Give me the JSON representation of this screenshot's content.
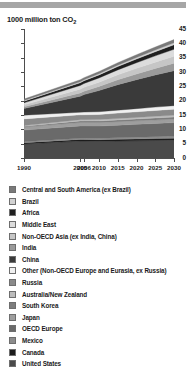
{
  "title": "1000 million ton CO",
  "title_sub": "2",
  "chart_data": {
    "type": "area",
    "title": "1000 million ton CO2",
    "xlabel": "",
    "ylabel": "1000 million ton CO2",
    "ylim": [
      0,
      45
    ],
    "yticks": [
      0,
      5,
      10,
      15,
      20,
      25,
      30,
      35,
      40,
      45
    ],
    "x": [
      1990,
      2005,
      2006,
      2010,
      2015,
      2020,
      2025,
      2030
    ],
    "xtick_labels": [
      "1990",
      "2005",
      "2006",
      "2010",
      "2015",
      "2020",
      "2025",
      "2030"
    ],
    "grid": false,
    "legend_position": "below",
    "stacked": true,
    "series": [
      {
        "name": "United States",
        "color": "#4a4a4a",
        "values": [
          4.9,
          5.9,
          5.9,
          5.8,
          5.9,
          6.0,
          6.1,
          6.2
        ]
      },
      {
        "name": "Canada",
        "color": "#1c1c1c",
        "values": [
          0.45,
          0.58,
          0.58,
          0.6,
          0.63,
          0.66,
          0.69,
          0.72
        ]
      },
      {
        "name": "Mexico",
        "color": "#8c8c8c",
        "values": [
          0.3,
          0.4,
          0.41,
          0.45,
          0.52,
          0.59,
          0.66,
          0.73
        ]
      },
      {
        "name": "OECD Europe",
        "color": "#6a6a6a",
        "values": [
          4.1,
          4.3,
          4.3,
          4.3,
          4.4,
          4.5,
          4.6,
          4.7
        ]
      },
      {
        "name": "Japan",
        "color": "#9e9e9e",
        "values": [
          1.05,
          1.23,
          1.22,
          1.22,
          1.22,
          1.22,
          1.22,
          1.22
        ]
      },
      {
        "name": "South Korea",
        "color": "#7d7d7d",
        "values": [
          0.24,
          0.5,
          0.51,
          0.55,
          0.6,
          0.64,
          0.68,
          0.72
        ]
      },
      {
        "name": "Australia/New Zealand",
        "color": "#bcbcbc",
        "values": [
          0.3,
          0.45,
          0.46,
          0.48,
          0.52,
          0.56,
          0.6,
          0.64
        ]
      },
      {
        "name": "Russia",
        "color": "#8a8a8a",
        "values": [
          2.3,
          1.7,
          1.72,
          1.78,
          1.87,
          1.95,
          2.03,
          2.1
        ]
      },
      {
        "name": "Other (Non-OECD Europe and Eurasia, ex Russia)",
        "color": "#f0f0f0",
        "values": [
          1.3,
          0.9,
          0.91,
          0.96,
          1.03,
          1.1,
          1.17,
          1.24
        ]
      },
      {
        "name": "China",
        "color": "#3a3a3a",
        "values": [
          2.3,
          5.6,
          6.1,
          7.4,
          8.9,
          10.1,
          11.2,
          12.2
        ]
      },
      {
        "name": "India",
        "color": "#9a9a9a",
        "values": [
          0.6,
          1.15,
          1.2,
          1.4,
          1.7,
          2.0,
          2.3,
          2.62
        ]
      },
      {
        "name": "Non-OECD Asia (ex India, China)",
        "color": "#c6c6c6",
        "values": [
          0.7,
          1.3,
          1.34,
          1.5,
          1.72,
          1.95,
          2.18,
          2.4
        ]
      },
      {
        "name": "Middle East",
        "color": "#dcdcdc",
        "values": [
          0.7,
          1.3,
          1.34,
          1.5,
          1.73,
          1.96,
          2.2,
          2.44
        ]
      },
      {
        "name": "Africa",
        "color": "#1f1f1f",
        "values": [
          0.6,
          0.95,
          0.97,
          1.05,
          1.18,
          1.31,
          1.44,
          1.57
        ]
      },
      {
        "name": "Brazil",
        "color": "#d2d2d2",
        "values": [
          0.22,
          0.35,
          0.36,
          0.4,
          0.46,
          0.53,
          0.6,
          0.67
        ]
      },
      {
        "name": "Central and South America (ex Brazil)",
        "color": "#797979",
        "values": [
          0.5,
          0.7,
          0.71,
          0.77,
          0.86,
          0.95,
          1.04,
          1.13
        ]
      }
    ]
  },
  "legend": {
    "items": [
      {
        "label": "Central and South America (ex Brazil)",
        "color": "#797979"
      },
      {
        "label": "Brazil",
        "color": "#d2d2d2"
      },
      {
        "label": "Africa",
        "color": "#1f1f1f"
      },
      {
        "label": "Middle East",
        "color": "#dcdcdc"
      },
      {
        "label": "Non-OECD Asia (ex India, China)",
        "color": "#c6c6c6"
      },
      {
        "label": "India",
        "color": "#9a9a9a"
      },
      {
        "label": "China",
        "color": "#3a3a3a"
      },
      {
        "label": "Other (Non-OECD Europe and Eurasia, ex Russia)",
        "color": "#f0f0f0"
      },
      {
        "label": "Russia",
        "color": "#8a8a8a"
      },
      {
        "label": "Australia/New Zealand",
        "color": "#bcbcbc"
      },
      {
        "label": "South Korea",
        "color": "#7d7d7d"
      },
      {
        "label": "Japan",
        "color": "#9e9e9e"
      },
      {
        "label": "OECD Europe",
        "color": "#6a6a6a"
      },
      {
        "label": "Mexico",
        "color": "#8c8c8c"
      },
      {
        "label": "Canada",
        "color": "#1c1c1c"
      },
      {
        "label": "United States",
        "color": "#4a4a4a"
      }
    ]
  }
}
